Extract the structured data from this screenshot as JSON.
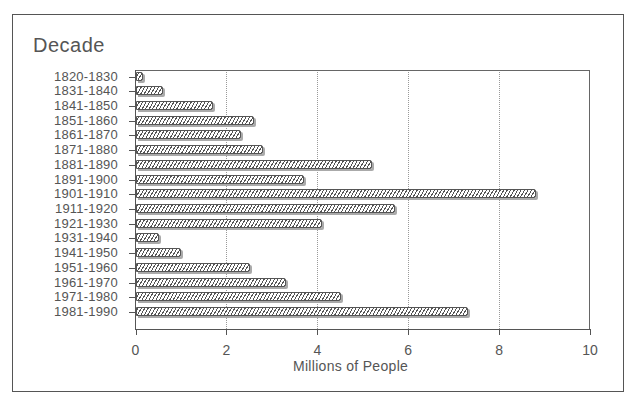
{
  "chart_data": {
    "type": "bar",
    "orientation": "horizontal",
    "title": "",
    "ylabel": "Decade",
    "xlabel": "Millions of People",
    "xlim": [
      0,
      10
    ],
    "xticks": [
      0,
      2,
      4,
      6,
      8,
      10
    ],
    "grid": "vertical dotted",
    "legend": null,
    "categories": [
      "1820-1830",
      "1831-1840",
      "1841-1850",
      "1851-1860",
      "1861-1870",
      "1871-1880",
      "1881-1890",
      "1891-1900",
      "1901-1910",
      "1911-1920",
      "1921-1930",
      "1931-1940",
      "1941-1950",
      "1951-1960",
      "1961-1970",
      "1971-1980",
      "1981-1990"
    ],
    "values": [
      0.15,
      0.6,
      1.7,
      2.6,
      2.3,
      2.8,
      5.2,
      3.7,
      8.8,
      5.7,
      4.1,
      0.5,
      1.0,
      2.5,
      3.3,
      4.5,
      7.3
    ]
  },
  "axis": {
    "y_title": "Decade",
    "x_title": "Millions of People",
    "x_tick_labels": [
      "0",
      "2",
      "4",
      "6",
      "8",
      "10"
    ]
  }
}
